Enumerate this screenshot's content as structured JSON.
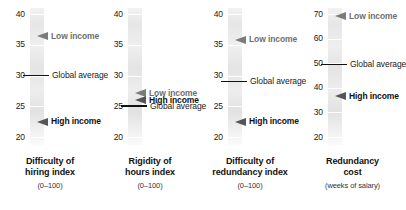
{
  "chart_data": {
    "type": "bar",
    "title": "",
    "subtitle": "",
    "xlabel": "",
    "ylabel": "",
    "grid": false,
    "legend": "inline-annotations",
    "panels": [
      {
        "id": "difficulty-of-hiring",
        "caption_line1": "Difficulty of",
        "caption_line2": "hiring index",
        "caption_sub": "(0–100)",
        "ylim": [
          20,
          40
        ],
        "ticks": [
          40,
          35,
          30,
          25,
          20
        ],
        "annotations": [
          {
            "label": "Low income",
            "value": 36.4,
            "style": "arrow-grey"
          },
          {
            "label": "Global average",
            "value": 30.0,
            "style": "rule"
          },
          {
            "label": "High income",
            "value": 22.5,
            "style": "arrow-dark"
          }
        ]
      },
      {
        "id": "rigidity-of-hours",
        "caption_line1": "Rigidity of",
        "caption_line2": "hours index",
        "caption_sub": "(0–100)",
        "ylim": [
          20,
          40
        ],
        "ticks": [
          40,
          35,
          30,
          25,
          20
        ],
        "annotations": [
          {
            "label": "Low income",
            "value": 27.1,
            "style": "arrow-grey"
          },
          {
            "label": "High income",
            "value": 26.0,
            "style": "arrow-dark"
          },
          {
            "label": "Global average",
            "value": 25.0,
            "style": "rule"
          }
        ]
      },
      {
        "id": "difficulty-of-redundancy",
        "caption_line1": "Difficulty of",
        "caption_line2": "redundancy index",
        "caption_sub": "(0–100)",
        "ylim": [
          20,
          40
        ],
        "ticks": [
          40,
          35,
          30,
          25,
          20
        ],
        "annotations": [
          {
            "label": "Low income",
            "value": 35.8,
            "style": "arrow-grey"
          },
          {
            "label": "Global average",
            "value": 29.0,
            "style": "rule"
          },
          {
            "label": "High income",
            "value": 22.5,
            "style": "arrow-dark"
          }
        ]
      },
      {
        "id": "redundancy-cost",
        "caption_line1": "Redundancy",
        "caption_line2": "cost",
        "caption_sub": "(weeks of salary)",
        "ylim": [
          20,
          70
        ],
        "ticks": [
          70,
          60,
          50,
          40,
          30,
          20
        ],
        "annotations": [
          {
            "label": "Low income",
            "value": 69.0,
            "style": "arrow-grey"
          },
          {
            "label": "Global average",
            "value": 49.5,
            "style": "rule"
          },
          {
            "label": "High income",
            "value": 36.5,
            "style": "arrow-dark"
          }
        ]
      }
    ],
    "colors": {
      "low_income_arrow": "#7b7b7b",
      "high_income_arrow": "#555555",
      "global_average_rule": "#111111",
      "bar_gradient_top": "#f2f2f2",
      "bar_gradient_bottom": "#fafafa",
      "text": "#1a1a1a",
      "background": "#ffffff"
    }
  }
}
